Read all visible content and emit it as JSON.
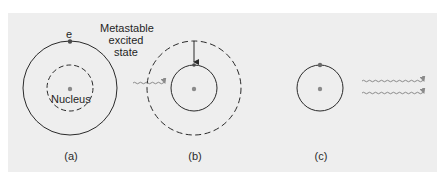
{
  "figure": {
    "panels": [
      {
        "id": "a",
        "caption": "(a)",
        "electron_label": "e",
        "state_label_lines": [
          "Metastable",
          "excited",
          "state"
        ],
        "nucleus_label": "Nucleus",
        "outer_orbit": "solid",
        "inner_orbit": "dashed",
        "electron_position": "outer-orbit-top"
      },
      {
        "id": "b",
        "caption": "(b)",
        "outer_orbit": "dashed",
        "inner_orbit": "solid",
        "transition": "electron drops from outer dashed orbit to inner solid orbit (downward arrow)",
        "incoming_photon": "wavy arrow entering from left"
      },
      {
        "id": "c",
        "caption": "(c)",
        "orbit": "solid",
        "electron_position": "orbit-top",
        "outgoing_photons": 2
      }
    ],
    "colors": {
      "panel_background": "#eeeeee",
      "page_background": "#ffffff",
      "line": "#2a2a2a",
      "photon_and_nucleus": "#8a8a8a"
    },
    "icons": {
      "photon": "wavy-arrow",
      "nucleus": "filled-dot",
      "electron": "filled-dot"
    }
  }
}
